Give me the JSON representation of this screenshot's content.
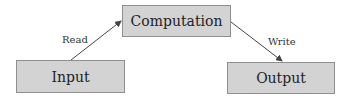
{
  "diagram": {
    "nodes": [
      {
        "id": "input",
        "label": "Input"
      },
      {
        "id": "computation",
        "label": "Computation"
      },
      {
        "id": "output",
        "label": "Output"
      }
    ],
    "edges": [
      {
        "from": "input",
        "to": "computation",
        "label": "Read"
      },
      {
        "from": "computation",
        "to": "output",
        "label": "Write"
      }
    ],
    "colors": {
      "box_fill": "#d3d3d3",
      "box_border": "#8f8f8f",
      "arrow": "#444444"
    }
  }
}
